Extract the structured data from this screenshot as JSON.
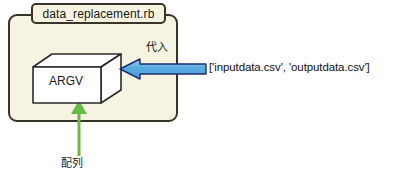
{
  "diagram": {
    "title_tab": {
      "label": "data_replacement.rb"
    },
    "program_box": {
      "fill_color": "#f6f4e0",
      "border_color": "#3a3328"
    },
    "argv_box": {
      "label": "ARGV",
      "fill_color": "#ffffff",
      "border_color": "#2b2b2b"
    },
    "assignment_arrow": {
      "label": "代入",
      "fill_color": "#5aaae0",
      "border_color": "#1b2f6b",
      "direction": "left"
    },
    "array_literal": {
      "text": "['inputdata.csv', 'outputdata.csv']"
    },
    "array_arrow": {
      "label": "配列",
      "color": "#6aba4a",
      "direction": "up"
    }
  }
}
